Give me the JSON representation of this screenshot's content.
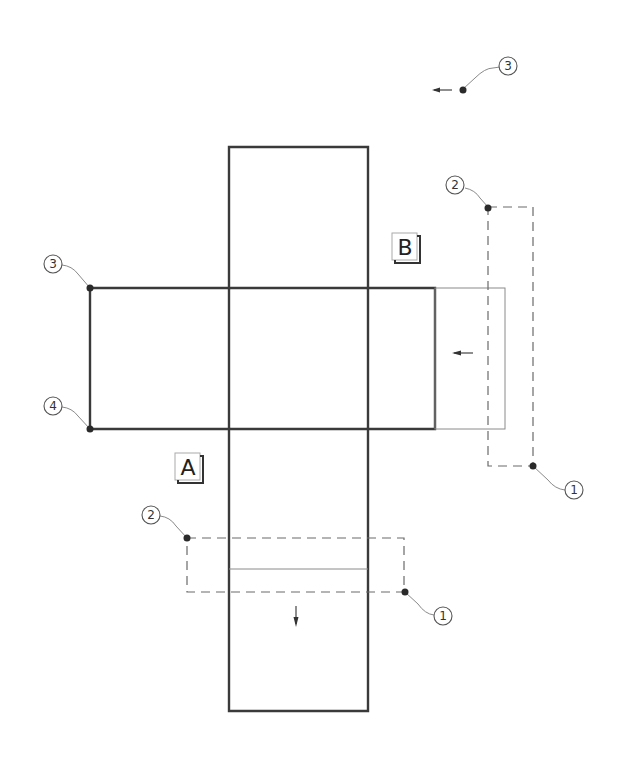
{
  "diagram": {
    "type": "cross-shaped surface net with region labels and numbered callouts",
    "regions": [
      {
        "id": "A",
        "label": "A"
      },
      {
        "id": "B",
        "label": "B"
      }
    ],
    "callouts": {
      "top_right": {
        "number": "3"
      },
      "right_box_top": {
        "number": "2"
      },
      "right_box_bottom": {
        "number": "1"
      },
      "left_top": {
        "number": "3"
      },
      "left_bottom": {
        "number": "4"
      },
      "lower_box_top": {
        "number": "2"
      },
      "lower_box_bottom": {
        "number": "1"
      }
    },
    "arrows": [
      {
        "id": "top-right-arrow",
        "direction": "left"
      },
      {
        "id": "right-panel-arrow",
        "direction": "left"
      },
      {
        "id": "bottom-arrow",
        "direction": "down"
      }
    ],
    "colors": {
      "line": "#3a3a3a",
      "thin_line": "#8a8a8a",
      "background": "#ffffff"
    }
  }
}
